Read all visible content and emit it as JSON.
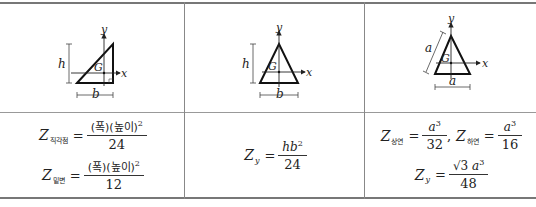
{
  "table": {
    "columns": [
      {
        "figure": {
          "shape": "right-triangle",
          "labels": {
            "height": "h",
            "base": "b",
            "centroid": "G",
            "x_axis": "x",
            "y_axis": "y"
          }
        },
        "formulas": [
          {
            "symbol": "Z",
            "subscript": "직각점",
            "equals": "=",
            "numerator": "(폭)(높이)",
            "numerator_exp": "2",
            "denominator": "24"
          },
          {
            "symbol": "Z",
            "subscript": "밑변",
            "equals": "=",
            "numerator": "(폭)(높이)",
            "numerator_exp": "2",
            "denominator": "12"
          }
        ]
      },
      {
        "figure": {
          "shape": "isosceles-triangle",
          "labels": {
            "height": "h",
            "base": "b",
            "centroid": "G",
            "x_axis": "x",
            "y_axis": "y"
          }
        },
        "formulas": [
          {
            "symbol": "Z",
            "subscript": "y",
            "equals": "=",
            "numerator": "hb",
            "numerator_exp": "2",
            "denominator": "24"
          }
        ]
      },
      {
        "figure": {
          "shape": "equilateral-triangle",
          "labels": {
            "side": "a",
            "base": "a",
            "centroid": "G",
            "x_axis": "x",
            "y_axis": "y"
          }
        },
        "formulas": [
          {
            "symbol": "Z",
            "subscript": "상연",
            "equals": "=",
            "numerator": "a",
            "numerator_exp": "3",
            "denominator": "32",
            "separator": ","
          },
          {
            "symbol": "Z",
            "subscript": "하연",
            "equals": "=",
            "numerator": "a",
            "numerator_exp": "3",
            "denominator": "16"
          },
          {
            "symbol": "Z",
            "subscript": "y",
            "equals": "=",
            "numerator_prefix": "√3",
            "numerator": "a",
            "numerator_exp": "3",
            "denominator": "48"
          }
        ]
      }
    ]
  }
}
